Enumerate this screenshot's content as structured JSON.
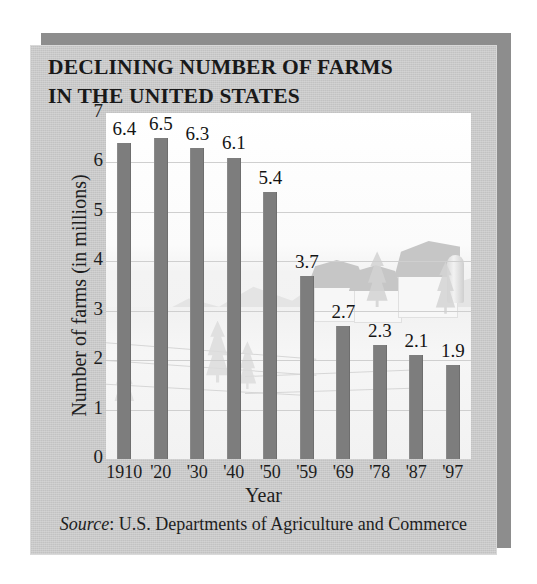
{
  "figure": {
    "title_line1": "DECLINING NUMBER OF FARMS",
    "title_line2": "IN THE UNITED STATES",
    "source_prefix": "Source",
    "source_separator": ": ",
    "source_text": "U.S. Departments of Agriculture and Commerce",
    "card_color": "#c9c9c9",
    "shadow_color": "#8d8d8d",
    "plot_color": "#fdfdfd",
    "bar_color": "#7d7d7d",
    "gridline_color": "#cfcfcf",
    "text_color": "#1d1d1d"
  },
  "chart_data": {
    "type": "bar",
    "title": "DECLINING NUMBER OF FARMS IN THE UNITED STATES",
    "xlabel": "Year",
    "ylabel": "Number of farms (in millions)",
    "categories": [
      "1910",
      "'20",
      "'30",
      "'40",
      "'50",
      "'59",
      "'69",
      "'78",
      "'87",
      "'97"
    ],
    "values": [
      6.4,
      6.5,
      6.3,
      6.1,
      5.4,
      3.7,
      2.7,
      2.3,
      2.1,
      1.9
    ],
    "value_labels": [
      "6.4",
      "6.5",
      "6.3",
      "6.1",
      "5.4",
      "3.7",
      "2.7",
      "2.3",
      "2.1",
      "1.9"
    ],
    "ylim": [
      0,
      7
    ],
    "yticks": [
      0,
      1,
      2,
      3,
      4,
      5,
      6,
      7
    ],
    "ytick_labels": [
      "0",
      "1",
      "2",
      "3",
      "4",
      "5",
      "6",
      "7"
    ],
    "grid": true,
    "grid_axis": "y",
    "legend": false,
    "background_image": "faded-farm-landscape-with-barns-silo-trees-mountains",
    "source": "Source: U.S. Departments of Agriculture and Commerce"
  }
}
